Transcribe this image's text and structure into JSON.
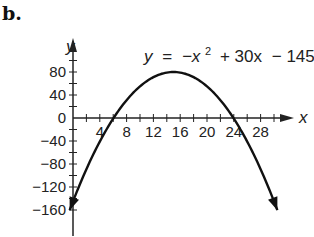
{
  "panel_label": "b.",
  "chart_data": {
    "type": "line",
    "title": "",
    "equation": "y = −x² + 30x − 145",
    "equation_parts": {
      "lhs": "y",
      "eq": "=",
      "t1": "−x",
      "exp": "2",
      "t2": "+ 30x",
      "t3": "− 145"
    },
    "xlabel": "x",
    "ylabel": "y",
    "x_ticks": [
      4,
      8,
      12,
      16,
      20,
      24,
      28
    ],
    "x_tick_labels": [
      "4",
      "8",
      "12",
      "16",
      "20",
      "24",
      "28"
    ],
    "y_ticks": [
      80,
      40,
      0,
      -40,
      -80,
      -120,
      -160
    ],
    "y_tick_labels": [
      "80",
      "40",
      "0",
      "−40",
      "−80",
      "−120",
      "−160"
    ],
    "xlim": [
      0,
      32
    ],
    "ylim": [
      -170,
      100
    ],
    "grid": false,
    "series": [
      {
        "name": "y = −x² + 30x − 145",
        "function": "-x^2 + 30x - 145",
        "points": [
          [
            0,
            -145
          ],
          [
            2,
            -89
          ],
          [
            4,
            -41
          ],
          [
            5.8,
            0
          ],
          [
            8,
            31
          ],
          [
            10,
            55
          ],
          [
            12,
            71
          ],
          [
            15,
            80
          ],
          [
            18,
            71
          ],
          [
            20,
            55
          ],
          [
            22,
            31
          ],
          [
            24.2,
            0
          ],
          [
            26,
            -41
          ],
          [
            28,
            -89
          ],
          [
            30,
            -145
          ]
        ]
      }
    ],
    "vertex": [
      15,
      80
    ],
    "roots": [
      5.8,
      24.2
    ],
    "y_intercept": -145
  }
}
